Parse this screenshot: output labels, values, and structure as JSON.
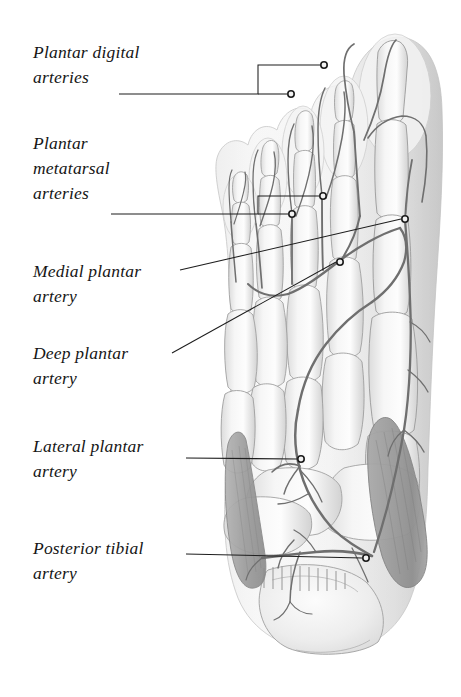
{
  "figure": {
    "view": "plantar view of right foot, superficial dissection",
    "style": "grayscale anatomical illustration",
    "background_color": "#ffffff",
    "ink_color": "#1d1d1d"
  },
  "labels": [
    {
      "id": "plantar-digital-arteries",
      "text": "Plantar digital\narteries",
      "x": 33,
      "y": 40,
      "leader_type": "bracket"
    },
    {
      "id": "plantar-metatarsal-arteries",
      "text": "Plantar\nmetatarsal\narteries",
      "x": 33,
      "y": 131,
      "leader_type": "bracket"
    },
    {
      "id": "medial-plantar-artery",
      "text": "Medial plantar\nartery",
      "x": 33,
      "y": 259,
      "leader_type": "line"
    },
    {
      "id": "deep-plantar-artery",
      "text": "Deep plantar\nartery",
      "x": 33,
      "y": 341,
      "leader_type": "line"
    },
    {
      "id": "lateral-plantar-artery",
      "text": "Lateral plantar\nartery",
      "x": 33,
      "y": 434,
      "leader_type": "line"
    },
    {
      "id": "posterior-tibial-artery",
      "text": "Posterior tibial\nartery",
      "x": 33,
      "y": 536,
      "leader_type": "line"
    }
  ],
  "leader_endpoints": [
    {
      "id": "digital-hallux",
      "x": 325,
      "y": 65
    },
    {
      "id": "digital-second-toe",
      "x": 291,
      "y": 94
    },
    {
      "id": "metatarsal-upper",
      "x": 323,
      "y": 196
    },
    {
      "id": "metatarsal-lower",
      "x": 292,
      "y": 214
    },
    {
      "id": "medial-plantar",
      "x": 405,
      "y": 219
    },
    {
      "id": "deep-plantar",
      "x": 340,
      "y": 262
    },
    {
      "id": "lateral-plantar",
      "x": 301,
      "y": 459
    },
    {
      "id": "posterior-tibial",
      "x": 366,
      "y": 558
    }
  ],
  "anatomy": {
    "toes": [
      "hallux",
      "second-toe",
      "third-toe",
      "fourth-toe",
      "fifth-toe"
    ],
    "structures": [
      "plantar digital arteries",
      "plantar metatarsal arteries",
      "deep plantar arch",
      "medial plantar artery",
      "lateral plantar artery",
      "deep plantar artery",
      "posterior tibial artery",
      "metatarsal bones",
      "phalanges",
      "calcaneus",
      "abductor hallucis muscle",
      "flexor digitorum brevis"
    ]
  }
}
